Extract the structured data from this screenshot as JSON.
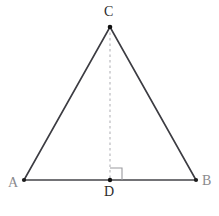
{
  "figure": {
    "width": 219,
    "height": 216,
    "background_color": "#ffffff"
  },
  "labels": {
    "A": "A",
    "B": "B",
    "C": "C",
    "D": "D"
  },
  "chart_data": {
    "type": "diagram",
    "subtype": "euclidean-geometry",
    "canvas": {
      "width": 219,
      "height": 216
    },
    "points": [
      {
        "name": "A",
        "x": 24,
        "y": 180,
        "label": "A",
        "label_x": 14,
        "label_y": 184,
        "label_color": "#8a8a8e",
        "marker": "dot"
      },
      {
        "name": "B",
        "x": 196,
        "y": 180,
        "label": "B",
        "label_x": 207,
        "label_y": 182,
        "label_color": "#8a8a8e",
        "marker": "dot"
      },
      {
        "name": "C",
        "x": 110,
        "y": 27,
        "label": "C",
        "label_x": 110,
        "label_y": 13,
        "label_color": "#2b2b2b",
        "marker": "dot"
      },
      {
        "name": "D",
        "x": 110,
        "y": 180,
        "label": "D",
        "label_x": 110,
        "label_y": 192,
        "label_color": "#2b2b2b",
        "marker": "dot"
      }
    ],
    "segments": [
      {
        "name": "AB",
        "from": "A",
        "to": "B",
        "style": "solid",
        "color": "#45454a",
        "width": 1.6
      },
      {
        "name": "AC",
        "from": "A",
        "to": "C",
        "style": "solid",
        "color": "#3c3c42",
        "width": 1.6
      },
      {
        "name": "BC",
        "from": "B",
        "to": "C",
        "style": "solid",
        "color": "#3c3c42",
        "width": 1.6
      },
      {
        "name": "CD",
        "from": "C",
        "to": "D",
        "style": "dashed",
        "color": "#b4b4b8",
        "width": 1.1,
        "dash": "2.5 3"
      }
    ],
    "angle_markers": [
      {
        "name": "right-angle-at-D",
        "at": "D",
        "type": "right-angle",
        "size": 12,
        "orientation": "up-right",
        "color": "#9a9a9e",
        "width": 1.1
      }
    ],
    "axes": {
      "visible": false
    },
    "grid": false,
    "legend": null
  }
}
